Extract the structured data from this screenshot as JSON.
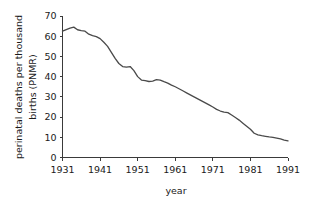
{
  "chart_data": {
    "type": "line",
    "title": "",
    "xlabel": "year",
    "ylabel": "perinatal deaths per thousand births (PNMR)",
    "ylabel_line1": "perinatal deaths per thousand",
    "ylabel_line2": "births (PNMR)",
    "xlim": [
      1931,
      1991
    ],
    "ylim": [
      0,
      70
    ],
    "xticks": [
      1931,
      1941,
      1951,
      1961,
      1971,
      1981,
      1991
    ],
    "yticks": [
      0,
      10,
      20,
      30,
      40,
      50,
      60,
      70
    ],
    "xtick_labels": [
      "1931",
      "1941",
      "1951",
      "1961",
      "1971",
      "1981",
      "1991"
    ],
    "ytick_labels": [
      "0",
      "10",
      "20",
      "30",
      "40",
      "50",
      "60",
      "70"
    ],
    "grid": false,
    "legend": "none",
    "line_color": "#4a4a4a",
    "axis_color": "#3a3a3a",
    "background_color": "#ffffff",
    "series": [
      {
        "name": "PNMR",
        "x": [
          1931,
          1932,
          1933,
          1934,
          1935,
          1936,
          1937,
          1938,
          1939,
          1940,
          1941,
          1942,
          1943,
          1944,
          1945,
          1946,
          1947,
          1948,
          1949,
          1950,
          1951,
          1952,
          1953,
          1954,
          1955,
          1956,
          1957,
          1958,
          1959,
          1960,
          1961,
          1962,
          1963,
          1964,
          1965,
          1966,
          1967,
          1968,
          1969,
          1970,
          1971,
          1972,
          1973,
          1974,
          1975,
          1976,
          1977,
          1978,
          1979,
          1980,
          1981,
          1982,
          1983,
          1984,
          1985,
          1986,
          1987,
          1988,
          1989,
          1990,
          1991
        ],
        "values": [
          62.5,
          63.3,
          64.0,
          64.5,
          63.2,
          62.8,
          62.5,
          61.0,
          60.3,
          59.8,
          58.8,
          57.0,
          55.0,
          52.0,
          49.0,
          46.5,
          45.0,
          44.7,
          45.0,
          43.0,
          40.0,
          38.3,
          38.0,
          37.6,
          37.8,
          38.5,
          38.3,
          37.5,
          36.8,
          35.8,
          35.0,
          34.0,
          33.0,
          32.0,
          31.0,
          30.0,
          29.0,
          28.0,
          27.0,
          26.0,
          25.0,
          23.8,
          23.0,
          22.5,
          22.2,
          21.0,
          19.8,
          18.5,
          17.0,
          15.5,
          14.0,
          12.0,
          11.2,
          10.8,
          10.5,
          10.2,
          10.0,
          9.6,
          9.2,
          8.6,
          8.2
        ]
      }
    ]
  }
}
